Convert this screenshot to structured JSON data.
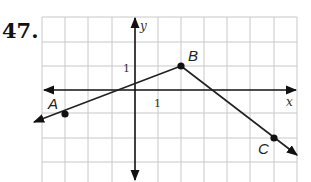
{
  "problem": {
    "number": "47."
  },
  "graph": {
    "x_axis_label": "x",
    "y_axis_label": "y",
    "x_tick_label": "1",
    "y_tick_label": "1",
    "grid": {
      "columns": 11,
      "rows_above_axis": 3,
      "rows_below_axis": 4
    },
    "points": [
      {
        "name": "A",
        "x": -3,
        "y": -1
      },
      {
        "name": "B",
        "x": 2,
        "y": 1
      },
      {
        "name": "C",
        "x": 6,
        "y": -2
      }
    ],
    "segments": [
      {
        "from": "A",
        "to": "B",
        "extends_beyond": "A",
        "arrow": true
      },
      {
        "from": "B",
        "to": "C",
        "extends_beyond": "C",
        "arrow": true
      }
    ],
    "colors": {
      "grid": "#c8c8c8",
      "axis": "#111111",
      "line": "#222222"
    }
  }
}
